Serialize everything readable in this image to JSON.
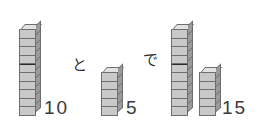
{
  "page": {
    "background_color": "#ffffff"
  },
  "palette": {
    "cube_front": "#c9c9c9",
    "cube_side": "#9b9b9b",
    "cube_top": "#e2e2e2",
    "cube_outline": "#6e6e6e",
    "text_color": "#3a3a3a"
  },
  "equation": {
    "operator_label": "と",
    "result_label": "で",
    "addend_a": "10",
    "addend_b": "5",
    "sum": "15"
  },
  "towers": [
    {
      "id": "tower-ten-left",
      "cube_count": 10,
      "label": "10",
      "marker_after_cube": 5,
      "x": 19,
      "bottom": 16
    },
    {
      "id": "tower-five-middle",
      "cube_count": 5,
      "label": "5",
      "marker_after_cube": 0,
      "x": 101,
      "bottom": 16
    },
    {
      "id": "tower-ten-right",
      "cube_count": 10,
      "label": "",
      "marker_after_cube": 5,
      "x": 171,
      "bottom": 16
    },
    {
      "id": "tower-five-right",
      "cube_count": 5,
      "label": "15",
      "marker_after_cube": 0,
      "x": 199,
      "bottom": 16
    }
  ],
  "labels": [
    {
      "id": "label-ten",
      "text": "10",
      "x": 44,
      "y": 98
    },
    {
      "id": "label-five",
      "text": "5",
      "x": 126,
      "y": 98
    },
    {
      "id": "label-fifteen",
      "text": "15",
      "x": 222,
      "y": 98
    },
    {
      "id": "label-to-kana",
      "text": "と",
      "x": 72,
      "y": 58
    },
    {
      "id": "label-de-kana",
      "text": "で",
      "x": 143,
      "y": 53
    }
  ]
}
